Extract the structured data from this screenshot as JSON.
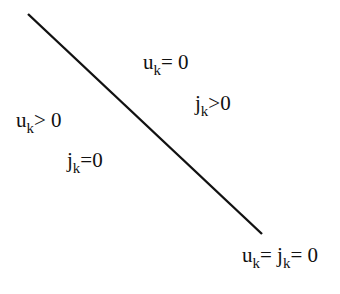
{
  "diagram": {
    "line": {
      "x1": 28,
      "y1": 14,
      "x2": 262,
      "y2": 234,
      "color": "#111111"
    },
    "labels": [
      {
        "id": "upper-u",
        "base": "u",
        "sub": "k",
        "rest": "= 0",
        "x": 143,
        "y": 52
      },
      {
        "id": "upper-j",
        "base": "j",
        "sub": "k",
        "rest": ">0",
        "x": 195,
        "y": 93
      },
      {
        "id": "lower-u",
        "base": "u",
        "sub": "k",
        "rest": "> 0",
        "x": 16,
        "y": 110
      },
      {
        "id": "lower-j",
        "base": "j",
        "sub": "k",
        "rest": "=0",
        "x": 67,
        "y": 150
      },
      {
        "id": "corner",
        "base": "u",
        "sub": "k",
        "mid": "= j",
        "sub2": "k",
        "rest": "= 0",
        "x": 242,
        "y": 245
      }
    ]
  }
}
